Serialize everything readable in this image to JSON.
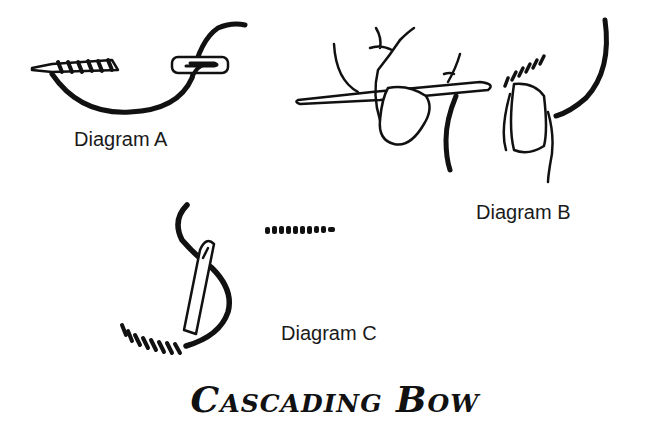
{
  "labels": {
    "a": "Diagram A",
    "b": "Diagram B",
    "c": "Diagram C"
  },
  "title": "Cascading Bow",
  "colors": {
    "ink": "#111111",
    "background": "#ffffff"
  }
}
